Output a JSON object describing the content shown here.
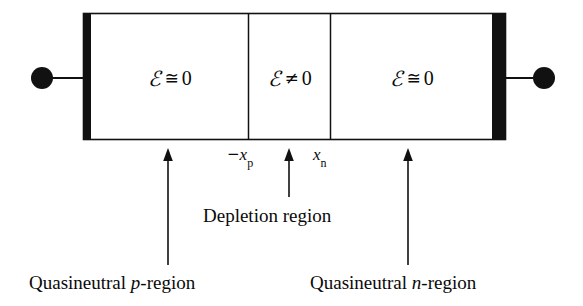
{
  "figure": {
    "background_color": "#ffffff",
    "ink_color": "#111111"
  },
  "device": {
    "regions": [
      {
        "id": "p-region-field",
        "symbol": "ℰ",
        "relation": "≅",
        "value": "0"
      },
      {
        "id": "depletion-region-field",
        "symbol": "ℰ",
        "relation": "≠",
        "value": "0"
      },
      {
        "id": "n-region-field",
        "symbol": "ℰ",
        "relation": "≅",
        "value": "0"
      }
    ],
    "contacts": {
      "left_terminal": "left-ohmic-contact",
      "right_terminal": "right-ohmic-contact"
    }
  },
  "ticks": {
    "left": {
      "sign": "−",
      "variable": "x",
      "subscript": "p"
    },
    "right": {
      "sign": "",
      "variable": "x",
      "subscript": "n"
    }
  },
  "annotations": {
    "depletion": "Depletion region",
    "left_region_prefix": "Quasineutral ",
    "left_region_italic": "p",
    "left_region_suffix": "-region",
    "right_region_prefix": "Quasineutral ",
    "right_region_italic": "n",
    "right_region_suffix": "-region"
  }
}
